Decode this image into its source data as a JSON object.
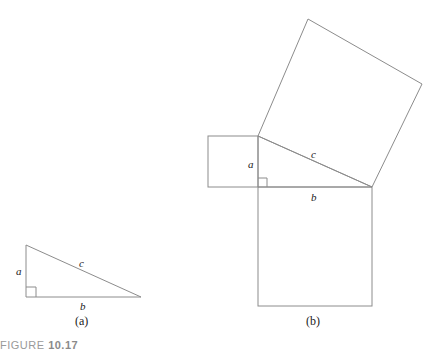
{
  "figure": {
    "label_word": "FIGURE",
    "label_number": "10.17"
  },
  "panel_a": {
    "caption": "(a)",
    "side_a": "a",
    "side_b": "b",
    "side_c": "c"
  },
  "panel_b": {
    "caption": "(b)",
    "side_a": "a",
    "side_b": "b",
    "side_c": "c"
  },
  "colors": {
    "stroke": "#8c8c8c",
    "text": "#222222",
    "figure_label": "#9a9a9a"
  }
}
